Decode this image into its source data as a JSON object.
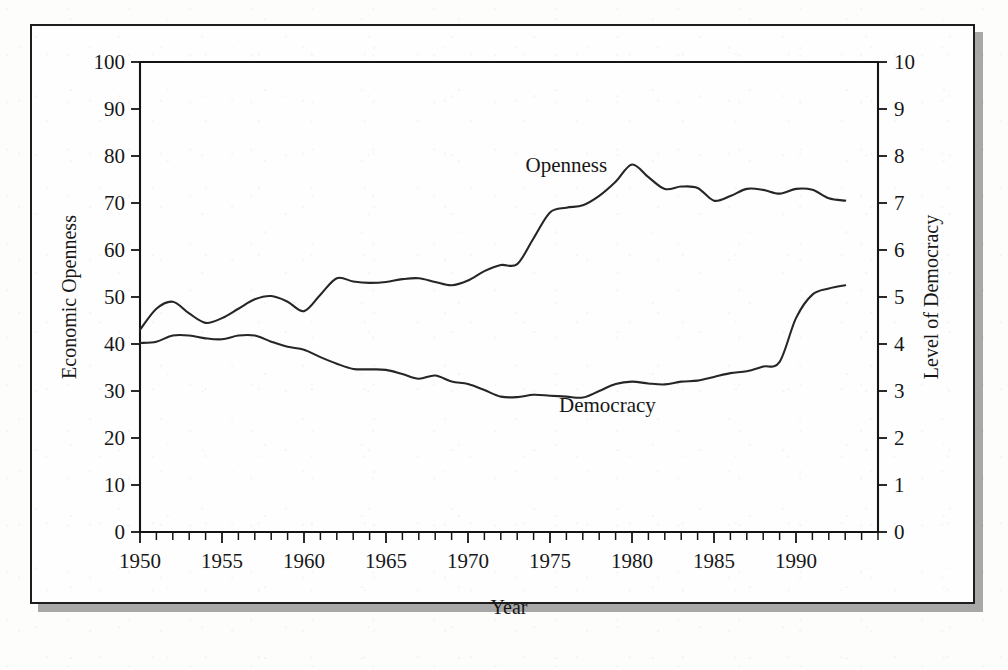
{
  "figure": {
    "background_color": "#fefefe",
    "border_color": "#1d1d1d",
    "shadow_color": "#a8a8a8",
    "line_color": "#262626"
  },
  "chart_data": {
    "type": "line",
    "title": "",
    "subtitle": "",
    "xlabel": "Year",
    "ylabel": "Economic Openness",
    "y2label": "Level of Democracy",
    "grid": false,
    "legend_position": "inline-annotation",
    "xlim": [
      1950,
      1995
    ],
    "ylim": [
      0,
      100
    ],
    "y2lim": [
      0,
      10
    ],
    "x_tick_labels": [
      "1950",
      "1955",
      "1960",
      "1965",
      "1970",
      "1975",
      "1980",
      "1985",
      "1990"
    ],
    "x_tick_values": [
      1950,
      1955,
      1960,
      1965,
      1970,
      1975,
      1980,
      1985,
      1990
    ],
    "x_minor_tick_step": 1,
    "y_tick_labels": [
      "0",
      "10",
      "20",
      "30",
      "40",
      "50",
      "60",
      "70",
      "80",
      "90",
      "100"
    ],
    "y_tick_values": [
      0,
      10,
      20,
      30,
      40,
      50,
      60,
      70,
      80,
      90,
      100
    ],
    "y2_tick_labels": [
      "0",
      "1",
      "2",
      "3",
      "4",
      "5",
      "6",
      "7",
      "8",
      "9",
      "10"
    ],
    "y2_tick_values": [
      0,
      1,
      2,
      3,
      4,
      5,
      6,
      7,
      8,
      9,
      10
    ],
    "annotations": [
      {
        "text": "Openness",
        "x": 1976.0,
        "y_axis": "left",
        "y": 76.5
      },
      {
        "text": "Democracy",
        "x": 1978.5,
        "y_axis": "right",
        "y": 2.55
      }
    ],
    "x": [
      1950,
      1951,
      1952,
      1953,
      1954,
      1955,
      1956,
      1957,
      1958,
      1959,
      1960,
      1961,
      1962,
      1963,
      1964,
      1965,
      1966,
      1967,
      1968,
      1969,
      1970,
      1971,
      1972,
      1973,
      1974,
      1975,
      1976,
      1977,
      1978,
      1979,
      1980,
      1981,
      1982,
      1983,
      1984,
      1985,
      1986,
      1987,
      1988,
      1989,
      1990,
      1991,
      1992,
      1993
    ],
    "series": [
      {
        "name": "Openness",
        "axis": "left",
        "units": "index",
        "values": [
          43.0,
          47.5,
          49.0,
          46.5,
          44.5,
          45.5,
          47.5,
          49.5,
          50.2,
          49.0,
          47.0,
          50.5,
          54.0,
          53.3,
          53.0,
          53.2,
          53.8,
          54.0,
          53.2,
          52.5,
          53.5,
          55.5,
          56.8,
          57.0,
          62.5,
          68.0,
          69.0,
          69.5,
          71.5,
          74.5,
          78.2,
          75.5,
          73.0,
          73.5,
          73.2,
          70.5,
          71.5,
          73.0,
          72.8,
          72.0,
          73.0,
          72.8,
          71.0,
          70.5
        ]
      },
      {
        "name": "Democracy",
        "axis": "right",
        "units": "polity score",
        "values": [
          4.02,
          4.05,
          4.18,
          4.18,
          4.12,
          4.1,
          4.18,
          4.18,
          4.05,
          3.94,
          3.88,
          3.72,
          3.58,
          3.47,
          3.46,
          3.45,
          3.36,
          3.26,
          3.33,
          3.2,
          3.15,
          3.02,
          2.88,
          2.87,
          2.92,
          2.9,
          2.88,
          2.86,
          3.0,
          3.15,
          3.2,
          3.16,
          3.14,
          3.2,
          3.22,
          3.3,
          3.38,
          3.42,
          3.52,
          3.62,
          4.55,
          5.05,
          5.18,
          5.25
        ]
      }
    ]
  }
}
